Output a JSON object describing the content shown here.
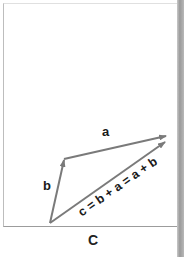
{
  "figure": {
    "caption": "C",
    "vectors": [
      {
        "name": "a",
        "label": "a",
        "from": [
          64,
          159
        ],
        "to": [
          167,
          136
        ]
      },
      {
        "name": "b",
        "label": "b",
        "from": [
          50,
          223
        ],
        "to": [
          64,
          159
        ]
      },
      {
        "name": "c",
        "label": "c = b + a = a + b",
        "from": [
          50,
          223
        ],
        "to": [
          166,
          141
        ]
      }
    ],
    "colors": {
      "arrow": "#7a7a7a",
      "text": "#1a1a1a",
      "frame": "#9c9c9c"
    }
  }
}
